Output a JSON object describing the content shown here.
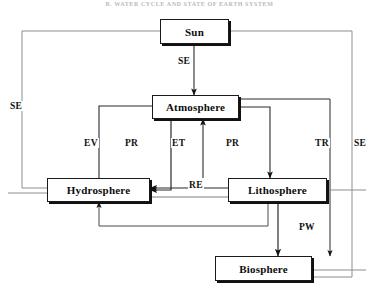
{
  "figure": {
    "header_caption": "B.  WATER CYCLE AND STATE OF EARTH SYSTEM",
    "width": 379,
    "height": 296,
    "line_color": "#1a1a1a",
    "thin_line_color": "#555555",
    "background": "#ffffff"
  },
  "nodes": [
    {
      "id": "sun",
      "label": "Sun",
      "x": 160,
      "y": 19,
      "w": 69,
      "h": 25
    },
    {
      "id": "atmosphere",
      "label": "Atmosphere",
      "x": 152,
      "y": 95,
      "w": 87,
      "h": 24
    },
    {
      "id": "hydrosphere",
      "label": "Hydrosphere",
      "x": 47,
      "y": 178,
      "w": 103,
      "h": 24
    },
    {
      "id": "lithosphere",
      "label": "Lithosphere",
      "x": 228,
      "y": 178,
      "w": 99,
      "h": 24
    },
    {
      "id": "biosphere",
      "label": "Biosphere",
      "x": 215,
      "y": 256,
      "w": 97,
      "h": 25
    }
  ],
  "edge_labels": [
    {
      "id": "se-sun-atmosphere",
      "text": "SE",
      "x": 177,
      "y": 56,
      "meaning": "solar energy from Sun to Atmosphere"
    },
    {
      "id": "se-left",
      "text": "SE",
      "x": 9,
      "y": 101,
      "meaning": "solar energy branch, left frame"
    },
    {
      "id": "ev-hydro-atmosphere",
      "text": "EV",
      "x": 83,
      "y": 138,
      "meaning": "evaporation"
    },
    {
      "id": "pr-atmosphere-hydro",
      "text": "PR",
      "x": 124,
      "y": 138,
      "meaning": "precipitation to hydrosphere"
    },
    {
      "id": "et-litho-atmosphere",
      "text": "ET",
      "x": 171,
      "y": 138,
      "meaning": "evapotranspiration"
    },
    {
      "id": "pr-atmosphere-litho",
      "text": "PR",
      "x": 225,
      "y": 138,
      "meaning": "precipitation to lithosphere"
    },
    {
      "id": "tr-right",
      "text": "TR",
      "x": 314,
      "y": 138,
      "meaning": "transfer / transpiration branch"
    },
    {
      "id": "se-right",
      "text": "SE",
      "x": 353,
      "y": 138,
      "meaning": "solar energy branch, right frame"
    },
    {
      "id": "re-litho-hydro",
      "text": "RE",
      "x": 188,
      "y": 180,
      "meaning": "runoff / return exchange"
    },
    {
      "id": "pw-litho-biosphere",
      "text": "PW",
      "x": 298,
      "y": 222,
      "meaning": "percolation / plant water"
    }
  ],
  "icons": {
    "arrowhead": "arrowhead-marker"
  }
}
